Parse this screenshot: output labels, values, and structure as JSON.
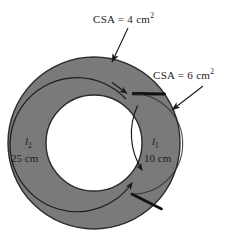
{
  "figure": {
    "colors": {
      "ring_fill": "#7a7a7a",
      "ring_stroke": "#2b2b2b",
      "boundary_stroke": "#111111",
      "background": "#ffffff",
      "text": "#1a1a1a"
    },
    "geometry": {
      "center_x": 94,
      "center_y": 143,
      "outer_radius": 86,
      "inner_radius": 48,
      "mid_radius": 67
    }
  },
  "annotations": {
    "csa_top": {
      "text": "CSA = 4 cm",
      "exponent": "2",
      "icon": "leader-arrow-icon"
    },
    "csa_right": {
      "text": "CSA = 6 cm",
      "exponent": "2",
      "icon": "leader-arrow-icon"
    }
  },
  "paths": {
    "left": {
      "symbol": "l",
      "subscript": "2",
      "length": "25 cm",
      "icon": "arc-arrow-icon"
    },
    "right": {
      "symbol": "l",
      "subscript": "1",
      "length": "10 cm",
      "icon": "arc-arrow-icon"
    }
  }
}
